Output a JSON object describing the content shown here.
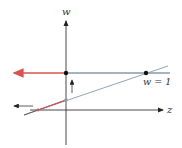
{
  "diagram": {
    "axes": {
      "vertical_label": "w",
      "horizontal_label": "z"
    },
    "line_label": "w = 1",
    "colors": {
      "axis": "#333333",
      "line": "#8a9aa6",
      "highlight": "#d9534f",
      "point": "#111111"
    }
  }
}
